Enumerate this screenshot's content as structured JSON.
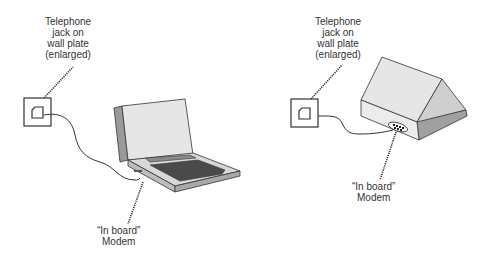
{
  "diagram": {
    "left_panel": {
      "jack_label": [
        "Telephone",
        "jack on",
        "wall plate",
        "(enlarged)"
      ],
      "modem_label": [
        "“In board”",
        "Modem"
      ],
      "device": "laptop-computer"
    },
    "right_panel": {
      "jack_label": [
        "Telephone",
        "jack on",
        "wall plate",
        "(enlarged)"
      ],
      "modem_label": [
        "“In board”",
        "Modem"
      ],
      "device": "notebook-computer-closed-rear-view"
    },
    "colors": {
      "line": "#333333",
      "lid": "#e6e6e6",
      "side": "#9a9a9a",
      "keyboard": "#4a4a4a",
      "base_top": "#d8d8d8",
      "base_front": "#bdbdbd"
    }
  }
}
